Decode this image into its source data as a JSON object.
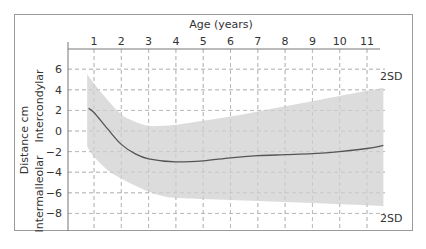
{
  "chart_data": {
    "type": "area",
    "title": "",
    "xlabel": "Age (years)",
    "ylabel": "Distance cm",
    "ylabel_upper": "Intercondylar",
    "ylabel_lower": "Intermalleolar",
    "x_ticks": [
      "1",
      "2",
      "3",
      "4",
      "5",
      "6",
      "7",
      "8",
      "9",
      "10",
      "11"
    ],
    "y_ticks": [
      "6",
      "4",
      "2",
      "0",
      "−2",
      "−4",
      "−6",
      "−8"
    ],
    "y_tick_values": [
      6,
      4,
      2,
      0,
      -2,
      -4,
      -6,
      -8
    ],
    "xlim": [
      0.75,
      11.6
    ],
    "ylim": [
      -10,
      8
    ],
    "grid": true,
    "annotations": [
      {
        "text": "2SD",
        "position": "upper-right"
      },
      {
        "text": "2SD",
        "position": "lower-right"
      }
    ],
    "series": [
      {
        "name": "Mean",
        "x": [
          0.8,
          1,
          1.5,
          2,
          2.5,
          3,
          4,
          5,
          6,
          7,
          8,
          9,
          10,
          11,
          11.6
        ],
        "values": [
          2.2,
          1.8,
          0.2,
          -1.3,
          -2.2,
          -2.7,
          -3.0,
          -2.9,
          -2.6,
          -2.4,
          -2.3,
          -2.2,
          -2.0,
          -1.7,
          -1.4
        ]
      },
      {
        "name": "+2SD",
        "x": [
          0.75,
          1,
          1.5,
          2,
          2.5,
          3,
          3.5,
          4,
          5,
          6,
          7,
          8,
          9,
          10,
          11,
          11.6
        ],
        "values": [
          5.5,
          4.6,
          3.0,
          1.6,
          0.9,
          0.5,
          0.5,
          0.6,
          1.0,
          1.4,
          1.9,
          2.4,
          2.9,
          3.4,
          3.9,
          4.2
        ]
      },
      {
        "name": "−2SD",
        "x": [
          0.75,
          1,
          1.5,
          2,
          2.5,
          3,
          3.5,
          4,
          5,
          6,
          7,
          8,
          9,
          10,
          11,
          11.6
        ],
        "values": [
          -1.5,
          -2.5,
          -3.8,
          -4.6,
          -5.3,
          -5.9,
          -6.3,
          -6.5,
          -6.6,
          -6.7,
          -6.8,
          -6.9,
          -7.0,
          -7.1,
          -7.2,
          -7.3
        ]
      }
    ]
  },
  "labels": {
    "xlabel": "Age (years)",
    "ylabel": "Distance cm",
    "ylabel_upper": "Intercondylar",
    "ylabel_lower": "Intermalleolar",
    "sd_upper": "2SD",
    "sd_lower": "2SD"
  }
}
